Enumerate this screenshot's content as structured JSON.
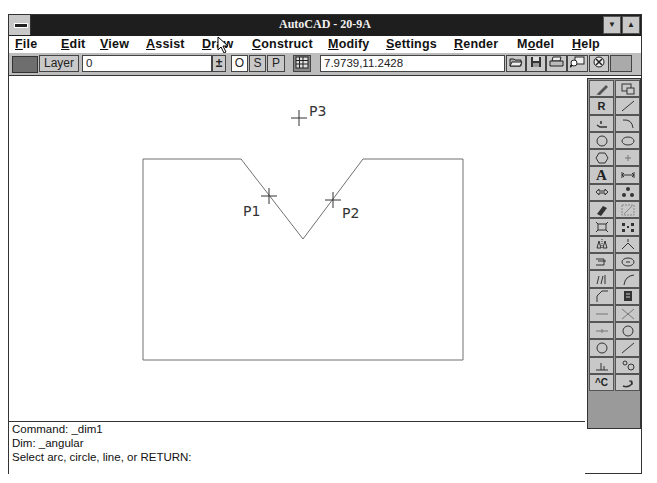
{
  "window": {
    "title": "AutoCAD - 20-9A",
    "minimize_glyph": "▼",
    "maximize_glyph": "▲"
  },
  "menubar": {
    "items": [
      {
        "label": "File",
        "mnemonic": "F",
        "rest": "ile",
        "x": 6
      },
      {
        "label": "Edit",
        "mnemonic": "E",
        "rest": "dit",
        "x": 52
      },
      {
        "label": "View",
        "mnemonic": "V",
        "rest": "iew",
        "x": 91
      },
      {
        "label": "Assist",
        "mnemonic": "A",
        "rest": "ssist",
        "x": 137
      },
      {
        "label": "Draw",
        "mnemonic": "D",
        "rest": "raw",
        "x": 193
      },
      {
        "label": "Construct",
        "mnemonic": "C",
        "rest": "onstruct",
        "x": 243
      },
      {
        "label": "Modify",
        "mnemonic": "M",
        "rest": "odify",
        "x": 319
      },
      {
        "label": "Settings",
        "mnemonic": "S",
        "rest": "ettings",
        "x": 377
      },
      {
        "label": "Render",
        "mnemonic": "R",
        "rest": "ender",
        "x": 445
      },
      {
        "label": "Model",
        "mnemonic": "o",
        "pre": "M",
        "rest": "del",
        "x": 508
      },
      {
        "label": "Help",
        "mnemonic": "H",
        "rest": "elp",
        "x": 563
      }
    ]
  },
  "toolbar": {
    "layer_label": "Layer",
    "layer_value": "0",
    "dropdown_glyph": "±",
    "ortho_label": "O",
    "snap_label": "S",
    "paper_label": "P",
    "coordinates": "7.9739,11.2428",
    "icons": [
      "open-icon",
      "save-icon",
      "print-icon",
      "zoom-window-icon",
      "help-icon",
      "blank-button"
    ]
  },
  "drawing": {
    "labels": {
      "p1": "P1",
      "p2": "P2",
      "p3": "P3"
    },
    "colors": {
      "line": "#707070",
      "text": "#333333"
    }
  },
  "toolbox": {
    "tools": [
      {
        "name": "pencil-icon",
        "glyph": ""
      },
      {
        "name": "copy-window-icon",
        "glyph": ""
      },
      {
        "name": "redraw-icon",
        "glyph": "R"
      },
      {
        "name": "line-icon",
        "glyph": ""
      },
      {
        "name": "polyline-icon",
        "glyph": ""
      },
      {
        "name": "arc-icon",
        "glyph": ""
      },
      {
        "name": "circle-icon",
        "glyph": ""
      },
      {
        "name": "ellipse-icon",
        "glyph": ""
      },
      {
        "name": "polygon-icon",
        "glyph": ""
      },
      {
        "name": "point-icon",
        "glyph": ""
      },
      {
        "name": "text-icon",
        "glyph": "A"
      },
      {
        "name": "dimension-icon",
        "glyph": ""
      },
      {
        "name": "move-icon",
        "glyph": ""
      },
      {
        "name": "array-icon",
        "glyph": ""
      },
      {
        "name": "erase-icon",
        "glyph": ""
      },
      {
        "name": "stretch-icon",
        "glyph": ""
      },
      {
        "name": "explode-icon",
        "glyph": ""
      },
      {
        "name": "grips-icon",
        "glyph": ""
      },
      {
        "name": "mirror-icon",
        "glyph": ""
      },
      {
        "name": "rotate-icon",
        "glyph": ""
      },
      {
        "name": "offset-icon",
        "glyph": ""
      },
      {
        "name": "break-icon",
        "glyph": ""
      },
      {
        "name": "trim-icon",
        "glyph": ""
      },
      {
        "name": "fillet-icon",
        "glyph": ""
      },
      {
        "name": "chamfer-icon",
        "glyph": ""
      },
      {
        "name": "block-icon",
        "glyph": ""
      },
      {
        "name": "horizontal-line-icon",
        "glyph": ""
      },
      {
        "name": "cross-icon",
        "glyph": ""
      },
      {
        "name": "center-line-icon",
        "glyph": ""
      },
      {
        "name": "circle-center-icon",
        "glyph": ""
      },
      {
        "name": "donut-icon",
        "glyph": ""
      },
      {
        "name": "diagonal-line-icon",
        "glyph": ""
      },
      {
        "name": "ordinate-icon",
        "glyph": ""
      },
      {
        "name": "osnap-icon",
        "glyph": ""
      },
      {
        "name": "cancel-icon",
        "glyph": "^C"
      },
      {
        "name": "undo-icon",
        "glyph": ""
      }
    ]
  },
  "command_line": {
    "lines": [
      "Command: _dim1",
      "Dim: _angular",
      "Select arc, circle, line, or RETURN:"
    ]
  }
}
